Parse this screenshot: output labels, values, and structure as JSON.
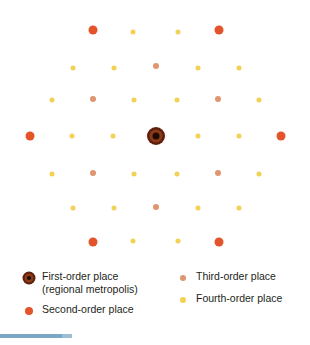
{
  "figure": {
    "background": "#ffffff",
    "colors": {
      "first_order_ring": "#5d1f0e",
      "first_order_mid": "#8c3a16",
      "first_order_core": "#1c0b05",
      "second_order": "#e4542a",
      "third_order": "#e0956e",
      "fourth_order": "#f2d154",
      "bottom_bar": "#7ba7c7"
    },
    "points": [
      {
        "x": 93,
        "y": 30,
        "order": 2
      },
      {
        "x": 133,
        "y": 32,
        "order": 4
      },
      {
        "x": 178,
        "y": 32,
        "order": 4
      },
      {
        "x": 219,
        "y": 30,
        "order": 2
      },
      {
        "x": 73,
        "y": 68,
        "order": 4
      },
      {
        "x": 114,
        "y": 68,
        "order": 4
      },
      {
        "x": 156,
        "y": 66,
        "order": 3
      },
      {
        "x": 198,
        "y": 68,
        "order": 4
      },
      {
        "x": 239,
        "y": 68,
        "order": 4
      },
      {
        "x": 52,
        "y": 100,
        "order": 4
      },
      {
        "x": 93,
        "y": 99,
        "order": 3
      },
      {
        "x": 134,
        "y": 100,
        "order": 4
      },
      {
        "x": 177,
        "y": 100,
        "order": 4
      },
      {
        "x": 218,
        "y": 99,
        "order": 3
      },
      {
        "x": 259,
        "y": 100,
        "order": 4
      },
      {
        "x": 30,
        "y": 136,
        "order": 2
      },
      {
        "x": 72,
        "y": 136,
        "order": 4
      },
      {
        "x": 113,
        "y": 136,
        "order": 4
      },
      {
        "x": 156,
        "y": 136,
        "order": 1
      },
      {
        "x": 198,
        "y": 136,
        "order": 4
      },
      {
        "x": 239,
        "y": 136,
        "order": 4
      },
      {
        "x": 281,
        "y": 136,
        "order": 2
      },
      {
        "x": 52,
        "y": 174,
        "order": 4
      },
      {
        "x": 93,
        "y": 173,
        "order": 3
      },
      {
        "x": 134,
        "y": 174,
        "order": 4
      },
      {
        "x": 177,
        "y": 174,
        "order": 4
      },
      {
        "x": 218,
        "y": 173,
        "order": 3
      },
      {
        "x": 259,
        "y": 174,
        "order": 4
      },
      {
        "x": 73,
        "y": 208,
        "order": 4
      },
      {
        "x": 114,
        "y": 208,
        "order": 4
      },
      {
        "x": 156,
        "y": 207,
        "order": 3
      },
      {
        "x": 198,
        "y": 208,
        "order": 4
      },
      {
        "x": 239,
        "y": 208,
        "order": 4
      },
      {
        "x": 93,
        "y": 242,
        "order": 2
      },
      {
        "x": 133,
        "y": 241,
        "order": 4
      },
      {
        "x": 178,
        "y": 241,
        "order": 4
      },
      {
        "x": 219,
        "y": 242,
        "order": 2
      }
    ]
  },
  "legend": {
    "left": [
      {
        "marker": "first-order-marker",
        "label": "First-order place",
        "sublabel": "(regional metropolis)"
      },
      {
        "marker": "second-order-marker",
        "label": "Second-order place",
        "sublabel": ""
      }
    ],
    "right": [
      {
        "marker": "third-order-marker",
        "label": "Third-order place",
        "sublabel": ""
      },
      {
        "marker": "fourth-order-marker",
        "label": "Fourth-order place",
        "sublabel": ""
      }
    ]
  }
}
